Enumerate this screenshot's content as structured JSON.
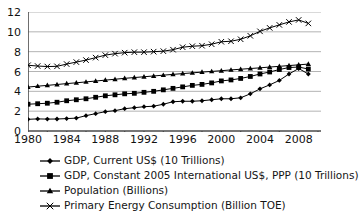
{
  "chart_data": {
    "type": "line",
    "title": "",
    "xlabel": "",
    "ylabel": "",
    "xlim": [
      1980,
      2010
    ],
    "ylim": [
      0,
      12
    ],
    "yticks": [
      0,
      2,
      4,
      6,
      8,
      10,
      12
    ],
    "xticks": [
      1980,
      1984,
      1988,
      1992,
      1996,
      2000,
      2004,
      2008
    ],
    "x_minor_tick_step": 2,
    "grid": "horizontal",
    "legend_position": "below",
    "x": [
      1980,
      1981,
      1982,
      1983,
      1984,
      1985,
      1986,
      1987,
      1988,
      1989,
      1990,
      1991,
      1992,
      1993,
      1994,
      1995,
      1996,
      1997,
      1998,
      1999,
      2000,
      2001,
      2002,
      2003,
      2004,
      2005,
      2006,
      2007,
      2008,
      2009
    ],
    "series": [
      {
        "name": "GDP, Current US$ (10 Trillions)",
        "marker": "diamond",
        "values": [
          1.18,
          1.22,
          1.2,
          1.21,
          1.25,
          1.3,
          1.55,
          1.75,
          1.95,
          2.05,
          2.25,
          2.35,
          2.45,
          2.5,
          2.7,
          2.95,
          3.0,
          3.0,
          3.05,
          3.15,
          3.25,
          3.25,
          3.35,
          3.75,
          4.25,
          4.65,
          5.1,
          5.75,
          6.3,
          5.75
        ]
      },
      {
        "name": "GDP, Constant 2005 International US$, PPP (10 Trillions)",
        "marker": "square",
        "values": [
          2.7,
          2.75,
          2.8,
          2.9,
          3.05,
          3.15,
          3.25,
          3.4,
          3.55,
          3.65,
          3.75,
          3.8,
          3.9,
          4.0,
          4.15,
          4.3,
          4.45,
          4.6,
          4.7,
          4.85,
          5.05,
          5.15,
          5.3,
          5.5,
          5.75,
          5.95,
          6.2,
          6.4,
          6.45,
          6.25
        ]
      },
      {
        "name": "Population (Billions)",
        "marker": "triangle",
        "values": [
          4.43,
          4.52,
          4.6,
          4.69,
          4.78,
          4.86,
          4.95,
          5.04,
          5.13,
          5.22,
          5.31,
          5.39,
          5.47,
          5.55,
          5.63,
          5.71,
          5.79,
          5.86,
          5.94,
          6.01,
          6.08,
          6.16,
          6.23,
          6.3,
          6.37,
          6.45,
          6.52,
          6.6,
          6.67,
          6.75
        ]
      },
      {
        "name": "Primary Energy Consumption (Billion TOE)",
        "marker": "cross",
        "values": [
          6.63,
          6.55,
          6.5,
          6.52,
          6.75,
          6.95,
          7.15,
          7.4,
          7.65,
          7.8,
          7.9,
          7.95,
          7.95,
          8.0,
          8.05,
          8.2,
          8.45,
          8.55,
          8.6,
          8.75,
          9.0,
          9.05,
          9.25,
          9.6,
          10.05,
          10.4,
          10.7,
          11.0,
          11.2,
          10.85
        ]
      }
    ]
  },
  "legend": {
    "items": [
      {
        "label": "GDP, Current US$ (10 Trillions)",
        "marker": "diamond"
      },
      {
        "label": "GDP, Constant 2005 International US$, PPP (10 Trillions)",
        "marker": "square"
      },
      {
        "label": "Population (Billions)",
        "marker": "triangle"
      },
      {
        "label": "Primary Energy Consumption (Billion TOE)",
        "marker": "cross"
      }
    ]
  },
  "colors": {
    "series": "#000000",
    "grid": "#b4b4b4",
    "axis": "#4a4a4a",
    "text": "#111111",
    "background": "#ffffff"
  }
}
